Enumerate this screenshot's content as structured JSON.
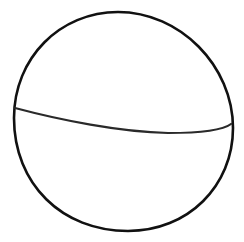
{
  "figure": {
    "background_color": "#ffffff",
    "stroke_color": "#111111",
    "outline": {
      "shape": "sphere-outline",
      "path": "M 118 12 C 60 12, 14 58, 14 118 C 14 184, 62 231, 128 231 C 188 231, 233 186, 233 128 C 233 66, 180 12, 118 12 Z",
      "stroke_width": 2.6
    },
    "equator": {
      "shape": "equator-curve",
      "path": "M 15 108 C 60 120, 120 132, 168 133 C 200 133, 222 131, 231 124",
      "stroke_width": 2.2,
      "stroke_color": "#2a2a2a"
    }
  }
}
